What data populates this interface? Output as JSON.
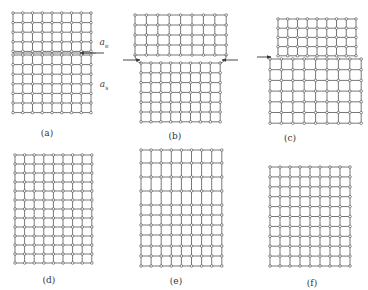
{
  "figure": {
    "panels": [
      {
        "id": "a",
        "label": "(a)",
        "label_pos": [
          47,
          133
        ],
        "grids": [
          {
            "x0": 13,
            "y0": 13,
            "cols": 9,
            "rows": 5,
            "dx": 9.75,
            "dy": 9.6
          },
          {
            "x0": 13,
            "y0": 55,
            "cols": 9,
            "rows": 7,
            "dx": 9.75,
            "dy": 9.6
          }
        ],
        "arrows": [
          {
            "x1": 104,
            "y1": 53,
            "x2": 80,
            "y2": 53
          }
        ],
        "symbols": [
          {
            "text": "a",
            "sub": "e",
            "pos": [
              104,
              43
            ]
          },
          {
            "text": "a",
            "sub": "s",
            "pos": [
              104,
              85
            ]
          }
        ]
      },
      {
        "id": "b",
        "label": "(b)",
        "label_pos": [
          175,
          136
        ],
        "grids": [
          {
            "x0": 135,
            "y0": 15,
            "cols": 9,
            "rows": 5,
            "dx": 11.4,
            "dy": 10
          },
          {
            "x0": 141,
            "y0": 63,
            "cols": 9,
            "rows": 7,
            "dx": 9.9,
            "dy": 9.8
          }
        ],
        "arrows": [
          {
            "x1": 123,
            "y1": 60,
            "x2": 140,
            "y2": 60
          },
          {
            "x1": 238,
            "y1": 60,
            "x2": 222,
            "y2": 60
          }
        ],
        "symbols": []
      },
      {
        "id": "c",
        "label": "(c)",
        "label_pos": [
          290,
          138
        ],
        "grids": [
          {
            "x0": 278,
            "y0": 19,
            "cols": 9,
            "rows": 5,
            "dx": 9.75,
            "dy": 9.2
          },
          {
            "x0": 270,
            "y0": 59,
            "cols": 9,
            "rows": 7,
            "dx": 11.4,
            "dy": 10.7
          }
        ],
        "arrows": [
          {
            "x1": 257,
            "y1": 57,
            "x2": 271,
            "y2": 57
          }
        ],
        "symbols": []
      },
      {
        "id": "d",
        "label": "(d)",
        "label_pos": [
          49,
          280
        ],
        "grids": [
          {
            "x0": 15,
            "y0": 155,
            "cols": 9,
            "rows": 13,
            "dx": 9.6,
            "dy": 9
          }
        ],
        "arrows": [],
        "symbols": []
      },
      {
        "id": "e",
        "label": "(e)",
        "label_pos": [
          176,
          281
        ],
        "grids_rows_y": [
          150,
          163,
          177,
          191,
          205,
          215,
          225,
          235,
          246,
          256,
          266
        ],
        "grids": [
          {
            "x0": 141,
            "y0": 150,
            "cols": 9,
            "rows": 0,
            "dx": 10.1,
            "dy": 0
          }
        ],
        "arrows": [],
        "symbols": []
      },
      {
        "id": "f",
        "label": "(f)",
        "label_pos": [
          312,
          283
        ],
        "grids": [
          {
            "x0": 270,
            "y0": 167,
            "cols": 9,
            "rows": 11,
            "dx": 10,
            "dy": 9.9
          }
        ],
        "arrows": [],
        "symbols": []
      }
    ],
    "colors": {
      "line": "#555555",
      "node_fill": "#ffffff",
      "node_stroke": "#444444",
      "arrow": "#333333"
    }
  }
}
